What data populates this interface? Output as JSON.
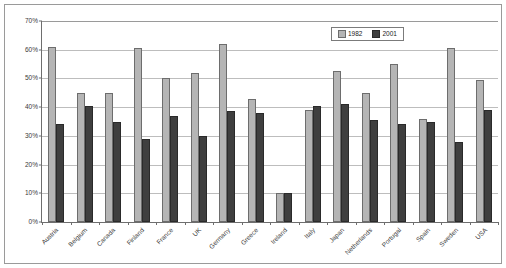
{
  "chart_data": {
    "type": "bar",
    "title": "",
    "xlabel": "",
    "ylabel": "",
    "ylim": [
      0,
      70
    ],
    "ytick_labels": [
      "0%",
      "10%",
      "20%",
      "30%",
      "40%",
      "50%",
      "60%",
      "70%"
    ],
    "ytick_values": [
      0,
      10,
      20,
      30,
      40,
      50,
      60,
      70
    ],
    "grid": true,
    "legend_position": "top-right",
    "categories": [
      "Austria",
      "Belgium",
      "Canada",
      "Finland",
      "France",
      "UK",
      "Germany",
      "Greece",
      "Ireland",
      "Italy",
      "Japan",
      "Netherlands",
      "Portugal",
      "Spain",
      "Sweden",
      "USA"
    ],
    "series": [
      {
        "name": "1982",
        "color": "#b5b5b5",
        "values": [
          61,
          45,
          45,
          60.5,
          50,
          52,
          62,
          43,
          10,
          39,
          52.5,
          45,
          55,
          36,
          60.5,
          49.5
        ]
      },
      {
        "name": "2001",
        "color": "#3f3f3f",
        "values": [
          34,
          40.5,
          35,
          29,
          37,
          30,
          38.5,
          38,
          10,
          40.5,
          41,
          35.5,
          34,
          35,
          28,
          39
        ]
      }
    ]
  },
  "legend": {
    "items": [
      {
        "label": "1982",
        "swatch": "legend-swatch-1982"
      },
      {
        "label": "2001",
        "swatch": "legend-swatch-2001"
      }
    ]
  }
}
